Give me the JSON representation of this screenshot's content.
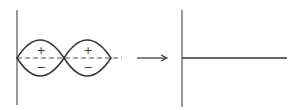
{
  "diagram": {
    "left_panel": {
      "description": "standing wave with two lobes",
      "lobe_labels": [
        {
          "top": "+",
          "bottom": "−"
        },
        {
          "top": "+",
          "bottom": "−"
        }
      ]
    },
    "arrow": {
      "direction": "right"
    },
    "right_panel": {
      "description": "flat line (zero amplitude)"
    },
    "colors": {
      "stroke": "#333333",
      "background": "#ffffff"
    }
  }
}
